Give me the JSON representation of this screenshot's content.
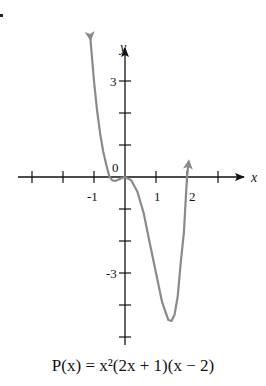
{
  "chart_data": {
    "type": "line",
    "title": "",
    "caption": "P(x) = x²(2x + 1)(x − 2)",
    "function": "P(x) = x^2(2x+1)(x-2)",
    "xlabel": "x",
    "ylabel": "y",
    "x_tick_labels": [
      "-1",
      "1",
      "2"
    ],
    "y_tick_labels": [
      "3",
      "-3"
    ],
    "origin_label": "0",
    "x_ticks": [
      -3,
      -2,
      -1,
      1,
      2,
      3
    ],
    "y_ticks": [
      -5,
      -4,
      -3,
      -2,
      -1,
      1,
      2,
      3
    ],
    "xlim": [
      -3.5,
      3.6
    ],
    "ylim": [
      -5.2,
      4.5
    ],
    "grid": false,
    "legend": null,
    "series_provenance": "Points below are computed from the caption formula P(x) = x^2(2x+1)(x-2), not digitized from the curve pixels. Spot checks against the drawn curve (left arrow near y=3 at x≈-1, small dip near x≈-0.3, minimum near (1.6,-4.5), right arrow rising at x=2) agree with the formula.",
    "series": [
      {
        "name": "P(x)",
        "color": "#8a8a8a",
        "x": [
          -1.12,
          -1.0,
          -0.9,
          -0.8,
          -0.7,
          -0.6,
          -0.5,
          -0.4,
          -0.3,
          -0.2,
          -0.1,
          0.0,
          0.2,
          0.4,
          0.6,
          0.8,
          1.0,
          1.2,
          1.4,
          1.5,
          1.6,
          1.7,
          1.8,
          1.9,
          2.0,
          2.05
        ],
        "values": [
          4.36,
          3.0,
          2.07,
          1.34,
          0.78,
          0.37,
          0.0,
          -0.11,
          -0.12,
          -0.08,
          -0.03,
          0.0,
          -0.1,
          -0.46,
          -1.12,
          -2.07,
          -3.0,
          -3.92,
          -4.47,
          -4.5,
          -4.3,
          -3.73,
          -2.66,
          -1.73,
          0.0,
          0.43
        ]
      }
    ],
    "arrows": [
      "left branch up",
      "right branch up",
      "x-axis positive",
      "y-axis positive"
    ]
  }
}
